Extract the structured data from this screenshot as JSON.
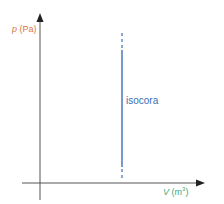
{
  "diagram": {
    "type": "pV-diagram",
    "y_axis": {
      "symbol": "p",
      "unit": "(Pa)",
      "color": "#e0733f"
    },
    "x_axis": {
      "symbol": "V",
      "unit_base": "(m",
      "unit_exp": "3",
      "unit_close": ")",
      "color": "#3aaa80"
    },
    "process": {
      "label": "isocora",
      "color": "#3b6fb5"
    },
    "axis_color": "#555555"
  }
}
